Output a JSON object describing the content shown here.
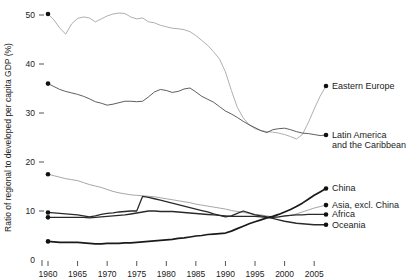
{
  "chart_data": {
    "type": "line",
    "title": "",
    "xlabel": "",
    "ylabel": "Ratio of regional to developed per capita GDP (%)",
    "xlim": [
      1960,
      2007
    ],
    "ylim": [
      0,
      52
    ],
    "grid": false,
    "legend_position": "right-inline-labels",
    "x_ticks": [
      "1960",
      "1965",
      "1970",
      "1975",
      "1980",
      "1985",
      "1990",
      "1995",
      "2000",
      "2005"
    ],
    "x_tick_values": [
      1960,
      1965,
      1970,
      1975,
      1980,
      1985,
      1990,
      1995,
      2000,
      2005
    ],
    "y_ticks": [
      "0",
      "10",
      "20",
      "30",
      "40",
      "50"
    ],
    "y_tick_values": [
      0,
      10,
      20,
      30,
      40,
      50
    ],
    "x": [
      1960,
      1961,
      1962,
      1963,
      1964,
      1965,
      1966,
      1967,
      1968,
      1969,
      1970,
      1971,
      1972,
      1973,
      1974,
      1975,
      1976,
      1977,
      1978,
      1979,
      1980,
      1981,
      1982,
      1983,
      1984,
      1985,
      1986,
      1987,
      1988,
      1989,
      1990,
      1991,
      1992,
      1993,
      1994,
      1995,
      1996,
      1997,
      1998,
      1999,
      2000,
      2001,
      2002,
      2003,
      2004,
      2005,
      2006,
      2007
    ],
    "series": [
      {
        "name": "Eastern Europe",
        "color": "#9a9a9a",
        "width": 0.8,
        "start_value": 50.2,
        "end_value": 35.5,
        "values": [
          50.2,
          49.0,
          47.3,
          46.1,
          48.2,
          49.3,
          49.6,
          49.4,
          48.6,
          49.2,
          49.8,
          50.2,
          50.4,
          50.3,
          49.6,
          49.2,
          49.4,
          48.6,
          48.4,
          47.9,
          47.6,
          47.3,
          47.2,
          47.0,
          46.6,
          45.8,
          44.8,
          43.8,
          42.5,
          41.0,
          38.4,
          34.6,
          31.2,
          29.0,
          27.6,
          26.8,
          26.4,
          26.2,
          26.1,
          25.9,
          25.6,
          25.2,
          24.7,
          25.6,
          28.0,
          30.8,
          33.4,
          35.5
        ]
      },
      {
        "name": "Latin America and the Caribbean",
        "color": "#4c4c4c",
        "width": 0.9,
        "start_value": 36.0,
        "end_value": 25.5,
        "values": [
          36.0,
          35.4,
          34.8,
          34.4,
          34.1,
          33.8,
          33.4,
          32.9,
          32.3,
          32.0,
          31.6,
          31.8,
          32.1,
          32.4,
          32.4,
          32.3,
          32.4,
          33.3,
          34.3,
          34.8,
          34.6,
          34.2,
          34.4,
          34.9,
          35.1,
          34.3,
          33.4,
          32.8,
          32.2,
          31.3,
          30.4,
          29.8,
          29.1,
          28.3,
          27.6,
          27.0,
          26.4,
          26.0,
          26.6,
          26.8,
          26.9,
          26.6,
          26.2,
          25.9,
          25.8,
          25.6,
          25.4,
          25.5
        ]
      },
      {
        "name": "Asia, excl. China",
        "color": "#8f8f8f",
        "width": 0.8,
        "start_value": 17.5,
        "end_value": 11.2,
        "values": [
          17.5,
          17.2,
          16.9,
          16.6,
          16.4,
          16.2,
          15.8,
          15.4,
          15.1,
          14.8,
          14.4,
          14.0,
          13.7,
          13.5,
          13.3,
          13.2,
          13.1,
          13.0,
          12.9,
          12.7,
          12.5,
          12.3,
          12.1,
          11.9,
          11.7,
          11.4,
          11.2,
          11.0,
          10.8,
          10.6,
          10.4,
          10.1,
          9.9,
          9.7,
          9.5,
          9.3,
          9.2,
          9.0,
          8.8,
          8.8,
          8.9,
          9.1,
          9.4,
          9.8,
          10.2,
          10.6,
          10.9,
          11.2
        ]
      },
      {
        "name": "Africa",
        "color": "#2a2a2a",
        "width": 1.3,
        "start_value": 9.7,
        "end_value": 9.3,
        "values": [
          9.7,
          9.6,
          9.5,
          9.4,
          9.3,
          9.2,
          9.0,
          8.8,
          9.0,
          9.3,
          9.5,
          9.6,
          9.8,
          9.9,
          10.0,
          10.0,
          13.0,
          12.8,
          12.5,
          12.2,
          11.9,
          11.6,
          11.3,
          11.0,
          10.7,
          10.4,
          10.1,
          9.8,
          9.4,
          9.1,
          8.8,
          9.0,
          9.5,
          10.0,
          9.6,
          9.2,
          9.0,
          8.8,
          8.7,
          8.8,
          9.0,
          9.1,
          9.2,
          9.2,
          9.3,
          9.3,
          9.3,
          9.3
        ]
      },
      {
        "name": "Oceania",
        "color": "#2a2a2a",
        "width": 1.4,
        "start_value": 8.7,
        "end_value": 7.2,
        "values": [
          8.7,
          8.7,
          8.7,
          8.7,
          8.7,
          8.7,
          8.7,
          8.6,
          8.7,
          8.8,
          8.9,
          9.0,
          9.1,
          9.2,
          9.4,
          9.6,
          9.8,
          10.0,
          10.0,
          9.9,
          9.9,
          9.9,
          9.8,
          9.7,
          9.6,
          9.5,
          9.4,
          9.3,
          9.2,
          9.1,
          9.0,
          8.9,
          8.9,
          8.9,
          8.9,
          8.9,
          8.8,
          8.7,
          8.5,
          8.2,
          7.9,
          7.7,
          7.5,
          7.4,
          7.3,
          7.2,
          7.2,
          7.2
        ]
      },
      {
        "name": "China",
        "color": "#1a1a1a",
        "width": 1.7,
        "start_value": 3.8,
        "end_value": 14.6,
        "values": [
          3.8,
          3.7,
          3.6,
          3.6,
          3.6,
          3.6,
          3.5,
          3.4,
          3.3,
          3.3,
          3.4,
          3.4,
          3.4,
          3.5,
          3.5,
          3.6,
          3.7,
          3.8,
          3.9,
          4.0,
          4.1,
          4.2,
          4.4,
          4.5,
          4.7,
          4.9,
          5.0,
          5.2,
          5.3,
          5.4,
          5.5,
          5.9,
          6.4,
          6.9,
          7.4,
          7.8,
          8.2,
          8.6,
          8.9,
          9.3,
          9.8,
          10.3,
          10.9,
          11.6,
          12.4,
          13.2,
          13.9,
          14.6
        ]
      }
    ],
    "series_labels": [
      {
        "name": "Eastern Europe",
        "text": "Eastern Europe"
      },
      {
        "name": "Latin America",
        "line1": "Latin America",
        "line2": "and the Caribbean"
      },
      {
        "name": "China",
        "text": "China"
      },
      {
        "name": "Asia",
        "text": "Asia, excl. China"
      },
      {
        "name": "Africa",
        "text": "Africa"
      },
      {
        "name": "Oceania",
        "text": "Oceania"
      }
    ]
  }
}
